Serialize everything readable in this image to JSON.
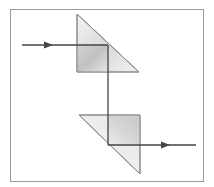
{
  "diagram": {
    "colors": {
      "frame": "#9a9a9a",
      "prism_edge": "#8a8a8a",
      "prism_fill_light": "#f2f2f2",
      "prism_fill_dark": "#c8c8c8",
      "beam": "#444444",
      "background": "#ffffff"
    },
    "elements": {
      "frame": {
        "x": 10,
        "y": 9,
        "width": 194,
        "height": 173
      },
      "prism_top": {
        "points": [
          [
            77,
            14
          ],
          [
            139,
            72
          ],
          [
            77,
            72
          ]
        ]
      },
      "prism_bottom": {
        "points": [
          [
            79,
            115
          ],
          [
            140,
            115
          ],
          [
            140,
            174
          ]
        ]
      },
      "beam": {
        "input": {
          "from": [
            22,
            45
          ],
          "to": [
            108,
            45
          ]
        },
        "vertical": {
          "from": [
            108,
            45
          ],
          "to": [
            108,
            145
          ]
        },
        "output": {
          "from": [
            108,
            145
          ],
          "to": [
            196,
            145
          ]
        }
      },
      "arrows": [
        {
          "name": "input-arrow",
          "tip": [
            53,
            45
          ],
          "direction": "right"
        },
        {
          "name": "output-arrow",
          "tip": [
            170,
            145
          ],
          "direction": "right"
        }
      ]
    }
  }
}
